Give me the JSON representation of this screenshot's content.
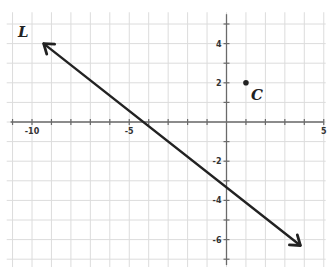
{
  "figure": {
    "type": "coordinate-plane",
    "x_range": [
      -11,
      5
    ],
    "y_range": [
      -7,
      5
    ],
    "grid": true,
    "x_tick_labels": [
      {
        "value": -10,
        "text": "-10"
      },
      {
        "value": -5,
        "text": "-5"
      },
      {
        "value": 5,
        "text": "5"
      }
    ],
    "y_tick_labels": [
      {
        "value": 4,
        "text": "4"
      },
      {
        "value": 2,
        "text": "2"
      },
      {
        "value": -2,
        "text": "-2"
      },
      {
        "value": -4,
        "text": "-4"
      },
      {
        "value": -6,
        "text": "-6"
      }
    ],
    "line": {
      "label": "L",
      "from": [
        -9.4,
        4
      ],
      "to": [
        3.8,
        -6.3
      ],
      "arrows": "both",
      "color": "#222222"
    },
    "point": {
      "label": "C",
      "x": 1,
      "y": 2,
      "color": "#222222"
    }
  }
}
